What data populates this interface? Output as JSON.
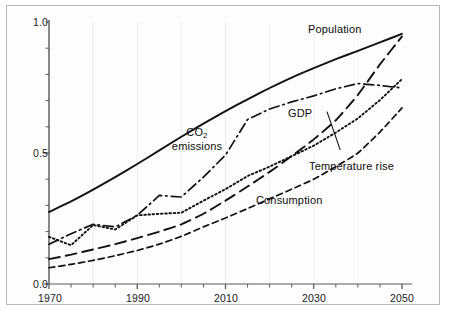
{
  "figure": {
    "background_color": "#fdfdfd",
    "frame_color": "#b9b9b9",
    "line_color": "#111111",
    "grid_color": "#f0f0f0"
  },
  "chart_data": {
    "type": "line",
    "title": "",
    "xlabel": "",
    "ylabel": "",
    "xlim": [
      1970,
      2050
    ],
    "ylim": [
      0.0,
      1.0
    ],
    "grid": true,
    "legend_position": "inline-annotations",
    "xticks": [
      1970,
      1990,
      2010,
      2030,
      2050
    ],
    "xtick_labels": [
      "1970",
      "1990",
      "2010",
      "2030",
      "2050"
    ],
    "xminor_step": 5,
    "yticks": [
      0.0,
      0.5,
      1.0
    ],
    "ytick_labels": [
      "0.0",
      "0.5",
      "1.0"
    ],
    "yminor_step": 0.1,
    "x": [
      1970,
      1975,
      1980,
      1985,
      1990,
      1995,
      2000,
      2005,
      2010,
      2015,
      2020,
      2025,
      2030,
      2035,
      2040,
      2045,
      2050
    ],
    "series": [
      {
        "name": "Population",
        "style": "solid",
        "label": "Population",
        "label_x": 2032,
        "label_y": 0.975,
        "values": [
          0.275,
          0.315,
          0.36,
          0.408,
          0.458,
          0.51,
          0.562,
          0.612,
          0.66,
          0.705,
          0.748,
          0.788,
          0.824,
          0.858,
          0.89,
          0.922,
          0.955
        ]
      },
      {
        "name": "GDP",
        "style": "long-dash",
        "label": "GDP",
        "label_x": 2029,
        "label_y": 0.645,
        "values": [
          0.095,
          0.112,
          0.132,
          0.152,
          0.175,
          0.2,
          0.228,
          0.268,
          0.318,
          0.372,
          0.428,
          0.488,
          0.552,
          0.625,
          0.722,
          0.838,
          0.945
        ]
      },
      {
        "name": "CO2 emissions",
        "style": "dash-dot",
        "label": "CO₂ emissions",
        "label_x": 2001,
        "label_y": 0.575,
        "values": [
          0.152,
          0.192,
          0.228,
          0.218,
          0.262,
          0.338,
          0.332,
          0.408,
          0.492,
          0.628,
          0.668,
          0.695,
          0.718,
          0.745,
          0.765,
          0.758,
          0.748
        ]
      },
      {
        "name": "Temperature rise",
        "style": "dotted",
        "label": "Temperature rise",
        "label_x": 2034,
        "label_y": 0.468,
        "leader_from": {
          "x": 2036,
          "y": 0.512
        },
        "leader_to": {
          "x": 2033,
          "y": 0.658
        },
        "values": [
          0.18,
          0.148,
          0.225,
          0.208,
          0.262,
          0.268,
          0.272,
          0.318,
          0.362,
          0.412,
          0.448,
          0.488,
          0.528,
          0.578,
          0.632,
          0.702,
          0.782
        ]
      },
      {
        "name": "Consumption",
        "style": "short-dash",
        "label": "Consumption",
        "label_x": 2010,
        "label_y": 0.3,
        "values": [
          0.062,
          0.075,
          0.09,
          0.108,
          0.128,
          0.152,
          0.182,
          0.218,
          0.252,
          0.288,
          0.325,
          0.362,
          0.4,
          0.448,
          0.5,
          0.58,
          0.672
        ]
      }
    ]
  }
}
